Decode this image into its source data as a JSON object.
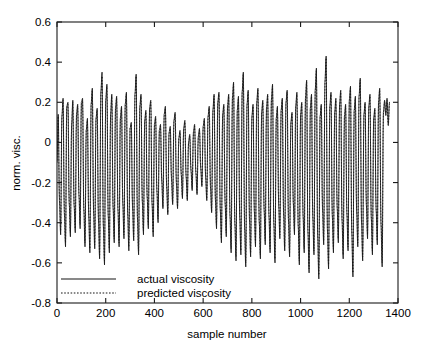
{
  "chart_data": {
    "type": "line",
    "title": "",
    "xlabel": "sample number",
    "ylabel": "norm. visc.",
    "xlim": [
      0,
      1400
    ],
    "ylim": [
      -0.8,
      0.6
    ],
    "xticks": [
      0,
      200,
      400,
      600,
      800,
      1000,
      1200,
      1400
    ],
    "yticks": [
      -0.8,
      -0.6,
      -0.4,
      -0.2,
      0,
      0.2,
      0.4,
      0.6
    ],
    "xtick_labels": [
      "0",
      "200",
      "400",
      "600",
      "800",
      "1000",
      "1200",
      "1400"
    ],
    "ytick_labels": [
      "-0.8",
      "-0.6",
      "-0.4",
      "-0.2",
      "0",
      "0.2",
      "0.4",
      "0.6"
    ],
    "grid": false,
    "legend_position": "lower left",
    "legend": [
      "actual viscosity",
      "predicted viscosity"
    ],
    "series": [
      {
        "name": "actual viscosity",
        "style": "solid",
        "color": "#141414",
        "x_start": 0,
        "x_step": 5,
        "values": [
          -0.1,
          0.14,
          -0.29,
          -0.46,
          0.13,
          0.22,
          -0.35,
          -0.52,
          0.18,
          0.2,
          -0.3,
          -0.47,
          0.09,
          0.21,
          -0.31,
          -0.45,
          0.14,
          0.19,
          -0.26,
          -0.43,
          0.2,
          0.22,
          -0.33,
          -0.52,
          0.06,
          0.12,
          -0.36,
          -0.55,
          0.19,
          0.27,
          -0.34,
          -0.53,
          0.12,
          0.17,
          -0.38,
          -0.58,
          0.25,
          0.35,
          -0.41,
          -0.61,
          0.21,
          0.29,
          -0.36,
          -0.55,
          0.14,
          0.24,
          -0.32,
          -0.5,
          0.17,
          0.23,
          -0.33,
          -0.52,
          0.12,
          0.18,
          -0.3,
          -0.48,
          0.19,
          0.25,
          -0.35,
          -0.54,
          0.07,
          0.1,
          -0.32,
          -0.49,
          0.24,
          0.34,
          -0.37,
          -0.56,
          0.18,
          0.24,
          -0.29,
          -0.46,
          0.11,
          0.16,
          -0.27,
          -0.43,
          0.17,
          0.21,
          -0.3,
          -0.47,
          0.09,
          0.13,
          -0.24,
          -0.4,
          0.06,
          0.09,
          -0.19,
          -0.33,
          0.14,
          0.18,
          -0.22,
          -0.36,
          0.05,
          0.08,
          -0.18,
          -0.31,
          0.11,
          0.15,
          -0.2,
          -0.33,
          0.02,
          0.06,
          -0.16,
          -0.28,
          0.07,
          0.11,
          -0.17,
          -0.29,
          0.0,
          0.04,
          -0.14,
          -0.24,
          0.05,
          0.09,
          -0.15,
          -0.26,
          0.03,
          0.07,
          -0.13,
          -0.22,
          0.08,
          0.12,
          -0.17,
          -0.29,
          0.13,
          0.18,
          -0.22,
          -0.35,
          0.16,
          0.24,
          -0.28,
          -0.43,
          0.2,
          0.25,
          -0.33,
          -0.5,
          0.14,
          0.19,
          -0.3,
          -0.47,
          0.18,
          0.24,
          -0.36,
          -0.55,
          0.22,
          0.3,
          -0.4,
          -0.59,
          0.16,
          0.23,
          -0.37,
          -0.56,
          0.25,
          0.35,
          -0.42,
          -0.62,
          0.19,
          0.26,
          -0.38,
          -0.57,
          0.13,
          0.19,
          -0.34,
          -0.52,
          0.2,
          0.27,
          -0.39,
          -0.58,
          0.15,
          0.21,
          -0.33,
          -0.51,
          0.17,
          0.24,
          -0.36,
          -0.55,
          0.21,
          0.29,
          -0.4,
          -0.6,
          0.12,
          0.18,
          -0.31,
          -0.48,
          0.16,
          0.22,
          -0.35,
          -0.54,
          0.2,
          0.26,
          -0.38,
          -0.57,
          0.1,
          0.15,
          -0.3,
          -0.46,
          0.18,
          0.25,
          -0.41,
          -0.61,
          0.14,
          0.2,
          -0.36,
          -0.55,
          0.22,
          0.31,
          -0.44,
          -0.65,
          0.17,
          0.24,
          -0.37,
          -0.56,
          0.26,
          0.37,
          -0.46,
          -0.68,
          0.13,
          0.19,
          -0.33,
          -0.51,
          0.3,
          0.43,
          -0.43,
          -0.63,
          0.18,
          0.25,
          -0.36,
          -0.55,
          0.15,
          0.22,
          -0.32,
          -0.5,
          0.19,
          0.26,
          -0.38,
          -0.58,
          0.13,
          0.19,
          -0.35,
          -0.54,
          0.21,
          0.28,
          -0.44,
          -0.67,
          0.16,
          0.23,
          -0.34,
          -0.52,
          0.23,
          0.32,
          -0.39,
          -0.59,
          0.14,
          0.2,
          -0.31,
          -0.48,
          0.18,
          0.24,
          -0.37,
          -0.56,
          0.12,
          0.17,
          -0.33,
          -0.51,
          0.2,
          0.27,
          -0.4,
          -0.62,
          0.15,
          0.21,
          0.14,
          0.22,
          0.09,
          0.2
        ]
      },
      {
        "name": "predicted viscosity",
        "style": "dotted",
        "color": "#141414",
        "x_start": 0,
        "x_step": 5,
        "values": [
          -0.09,
          0.13,
          -0.27,
          -0.44,
          0.12,
          0.21,
          -0.33,
          -0.5,
          0.17,
          0.19,
          -0.29,
          -0.45,
          0.08,
          0.2,
          -0.3,
          -0.43,
          0.13,
          0.18,
          -0.25,
          -0.41,
          0.19,
          0.21,
          -0.32,
          -0.5,
          0.06,
          0.11,
          -0.35,
          -0.53,
          0.18,
          0.26,
          -0.33,
          -0.51,
          0.11,
          0.16,
          -0.37,
          -0.56,
          0.24,
          0.33,
          -0.4,
          -0.59,
          0.2,
          0.28,
          -0.35,
          -0.53,
          0.13,
          0.23,
          -0.31,
          -0.48,
          0.16,
          0.22,
          -0.32,
          -0.5,
          0.11,
          0.17,
          -0.29,
          -0.46,
          0.18,
          0.24,
          -0.34,
          -0.52,
          0.07,
          0.09,
          -0.31,
          -0.47,
          0.23,
          0.33,
          -0.36,
          -0.54,
          0.17,
          0.23,
          -0.28,
          -0.44,
          0.1,
          0.15,
          -0.26,
          -0.41,
          0.16,
          0.2,
          -0.29,
          -0.45,
          0.08,
          0.12,
          -0.23,
          -0.38,
          0.05,
          0.08,
          -0.18,
          -0.32,
          0.13,
          0.17,
          -0.21,
          -0.35,
          0.04,
          0.07,
          -0.17,
          -0.3,
          0.1,
          0.14,
          -0.19,
          -0.32,
          0.02,
          0.05,
          -0.15,
          -0.27,
          0.06,
          0.1,
          -0.16,
          -0.28,
          0.0,
          0.03,
          -0.13,
          -0.23,
          0.04,
          0.08,
          -0.14,
          -0.25,
          0.02,
          0.06,
          -0.12,
          -0.21,
          0.07,
          0.11,
          -0.16,
          -0.28,
          0.12,
          0.17,
          -0.21,
          -0.34,
          0.15,
          0.23,
          -0.27,
          -0.41,
          0.19,
          0.24,
          -0.32,
          -0.48,
          0.13,
          0.18,
          -0.29,
          -0.45,
          0.17,
          0.23,
          -0.35,
          -0.53,
          0.21,
          0.29,
          -0.39,
          -0.57,
          0.15,
          0.22,
          -0.36,
          -0.54,
          0.24,
          0.34,
          -0.41,
          -0.6,
          0.18,
          0.25,
          -0.37,
          -0.55,
          0.12,
          0.18,
          -0.33,
          -0.5,
          0.19,
          0.26,
          -0.38,
          -0.56,
          0.14,
          0.2,
          -0.32,
          -0.49,
          0.16,
          0.23,
          -0.35,
          -0.53,
          0.2,
          0.28,
          -0.39,
          -0.58,
          0.11,
          0.17,
          -0.3,
          -0.46,
          0.15,
          0.21,
          -0.34,
          -0.52,
          0.19,
          0.25,
          -0.37,
          -0.55,
          0.09,
          0.14,
          -0.29,
          -0.44,
          0.17,
          0.24,
          -0.4,
          -0.59,
          0.13,
          0.19,
          -0.35,
          -0.53,
          0.21,
          0.3,
          -0.43,
          -0.63,
          0.16,
          0.23,
          -0.36,
          -0.54,
          0.25,
          0.36,
          -0.45,
          -0.66,
          0.12,
          0.18,
          -0.32,
          -0.49,
          0.29,
          0.42,
          -0.42,
          -0.61,
          0.17,
          0.24,
          -0.35,
          -0.53,
          0.14,
          0.21,
          -0.31,
          -0.48,
          0.18,
          0.25,
          -0.37,
          -0.56,
          0.12,
          0.18,
          -0.34,
          -0.52,
          0.2,
          0.27,
          -0.43,
          -0.65,
          0.15,
          0.22,
          -0.33,
          -0.5,
          0.22,
          0.31,
          -0.38,
          -0.57,
          0.13,
          0.19,
          -0.3,
          -0.46,
          0.17,
          0.23,
          -0.36,
          -0.54,
          0.11,
          0.16,
          -0.32,
          -0.49,
          0.19,
          0.26,
          -0.39,
          -0.6,
          0.14,
          0.2,
          0.13,
          0.21,
          0.08,
          0.19
        ]
      }
    ]
  },
  "axes": {
    "y_axis_title": "norm. visc.",
    "x_axis_title": "sample number"
  },
  "legend": {
    "entries": [
      {
        "label": "actual viscosity",
        "style": "solid"
      },
      {
        "label": "predicted viscosity",
        "style": "dotted"
      }
    ]
  },
  "colors": {
    "background": "#ffffff",
    "axis": "#1a1a1a",
    "series": "#141414"
  }
}
